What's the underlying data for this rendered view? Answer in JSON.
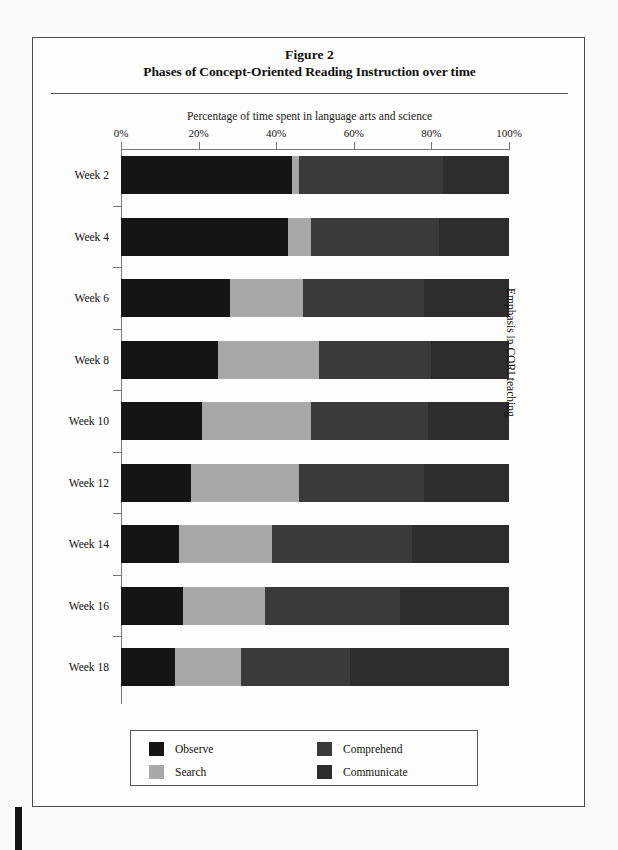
{
  "figure": {
    "title_line1": "Figure 2",
    "title_line2": "Phases of Concept-Oriented Reading Instruction over time",
    "axis_caption": "Percentage of time spent in language arts and science",
    "right_axis_title": "Emphasis in CORI teaching"
  },
  "chart_data": {
    "type": "bar",
    "orientation": "horizontal",
    "stacked": true,
    "stack_total": 100,
    "xlabel": "Percentage of time spent in language arts and science",
    "ylabel": "Emphasis in CORI teaching",
    "xlim": [
      0,
      100
    ],
    "grid": false,
    "legend_position": "bottom",
    "xtick_labels": [
      "0%",
      "20%",
      "40%",
      "60%",
      "80%",
      "100%"
    ],
    "xtick_values": [
      0,
      20,
      40,
      60,
      80,
      100
    ],
    "categories": [
      "Week 2",
      "Week 4",
      "Week 6",
      "Week 8",
      "Week 10",
      "Week 12",
      "Week 14",
      "Week 16",
      "Week 18"
    ],
    "series": [
      {
        "name": "Observe",
        "color": "#151515",
        "values": [
          44,
          43,
          28,
          25,
          21,
          18,
          15,
          16,
          14
        ]
      },
      {
        "name": "Search",
        "color": "#a8a8a8",
        "values": [
          2,
          6,
          19,
          26,
          28,
          28,
          24,
          21,
          17
        ]
      },
      {
        "name": "Comprehend",
        "color": "#3a3a3a",
        "values": [
          37,
          33,
          31,
          29,
          30,
          32,
          36,
          35,
          28
        ]
      },
      {
        "name": "Communicate",
        "color": "#2d2d2d",
        "values": [
          17,
          18,
          22,
          20,
          21,
          22,
          25,
          28,
          41
        ]
      }
    ]
  },
  "legend": {
    "entries": [
      {
        "label": "Observe",
        "color": "#151515"
      },
      {
        "label": "Search",
        "color": "#a8a8a8"
      },
      {
        "label": "Comprehend",
        "color": "#3a3a3a"
      },
      {
        "label": "Communicate",
        "color": "#2d2d2d"
      }
    ]
  }
}
